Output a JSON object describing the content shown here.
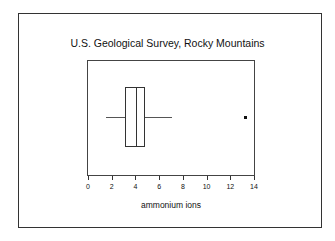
{
  "chart_data": {
    "type": "boxplot",
    "title": "U.S. Geological Survey, Rocky Mountains",
    "xlabel": "ammonium ions",
    "ylabel": "",
    "xlim": [
      0,
      14
    ],
    "xticks": [
      0,
      2,
      4,
      6,
      8,
      10,
      12,
      14
    ],
    "orientation": "horizontal",
    "grid": false,
    "series": [
      {
        "name": "ammonium ions",
        "whisker_low": 1.4,
        "q1": 3.0,
        "median": 4.0,
        "q3": 4.7,
        "whisker_high": 7.0,
        "outliers": [
          13.2
        ]
      }
    ]
  }
}
